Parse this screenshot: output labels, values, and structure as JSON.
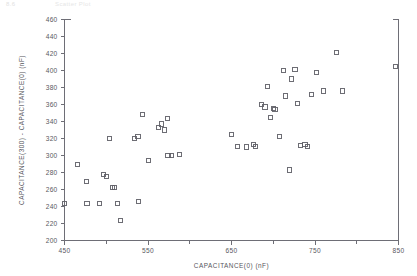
{
  "header": {
    "left_fragment": "8.6",
    "right_fragment": "Scatter Plot"
  },
  "chart_data": {
    "type": "scatter",
    "title": "",
    "xlabel": "CAPACITANCE(0)   (nF)",
    "ylabel": "CAPACITANCE(300)  -  CAPACITANCE(0)   (nF)",
    "xlim": [
      450,
      850
    ],
    "ylim": [
      200,
      460
    ],
    "xticks": [
      450,
      550,
      650,
      750,
      850
    ],
    "xticklabels": [
      "450",
      "550",
      "650",
      "750",
      "850"
    ],
    "xminorticks": [
      500,
      600,
      700,
      800
    ],
    "yticks": [
      200,
      220,
      240,
      260,
      280,
      300,
      320,
      340,
      360,
      380,
      400,
      420,
      440,
      460
    ],
    "yticklabels": [
      "200",
      "220",
      "240",
      "260",
      "280",
      "300",
      "320",
      "340",
      "360",
      "380",
      "400",
      "420",
      "440",
      "460"
    ],
    "grid": false,
    "legend": false,
    "marker": "open-square",
    "marker_color": "#5d5d65",
    "points": [
      [
        450,
        244
      ],
      [
        466,
        289
      ],
      [
        476,
        269
      ],
      [
        477,
        244
      ],
      [
        492,
        244
      ],
      [
        497,
        278
      ],
      [
        500,
        275
      ],
      [
        504,
        320
      ],
      [
        507,
        262
      ],
      [
        510,
        262
      ],
      [
        513,
        244
      ],
      [
        517,
        224
      ],
      [
        534,
        320
      ],
      [
        538,
        322
      ],
      [
        539,
        246
      ],
      [
        543,
        348
      ],
      [
        551,
        294
      ],
      [
        563,
        333
      ],
      [
        566,
        337
      ],
      [
        570,
        330
      ],
      [
        573,
        344
      ],
      [
        574,
        300
      ],
      [
        578,
        300
      ],
      [
        588,
        301
      ],
      [
        650,
        325
      ],
      [
        657,
        311
      ],
      [
        668,
        310
      ],
      [
        676,
        313
      ],
      [
        679,
        311
      ],
      [
        686,
        360
      ],
      [
        690,
        357
      ],
      [
        693,
        381
      ],
      [
        697,
        345
      ],
      [
        700,
        355
      ],
      [
        702,
        354
      ],
      [
        707,
        322
      ],
      [
        712,
        400
      ],
      [
        715,
        370
      ],
      [
        719,
        283
      ],
      [
        722,
        390
      ],
      [
        726,
        401
      ],
      [
        729,
        361
      ],
      [
        733,
        312
      ],
      [
        738,
        313
      ],
      [
        741,
        311
      ],
      [
        746,
        372
      ],
      [
        752,
        398
      ],
      [
        760,
        376
      ],
      [
        776,
        421
      ],
      [
        783,
        376
      ],
      [
        846,
        405
      ]
    ]
  }
}
